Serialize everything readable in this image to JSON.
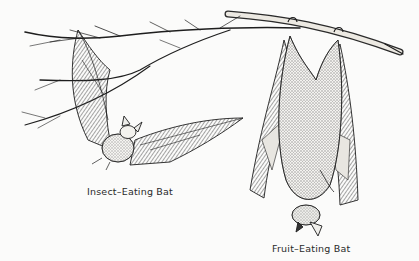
{
  "illustration": {
    "subject": "Two bats with a tree branch",
    "captions": {
      "insect_bat": "Insect–Eating Bat",
      "fruit_bat": "Fruit–Eating Bat"
    },
    "colors": {
      "background": "#fbfbfa",
      "ink": "#1e1e1e",
      "wing_shade": "#8a8a8a",
      "body_shade": "#6e6e6e",
      "branch_fill": "#e9e6e0"
    }
  }
}
